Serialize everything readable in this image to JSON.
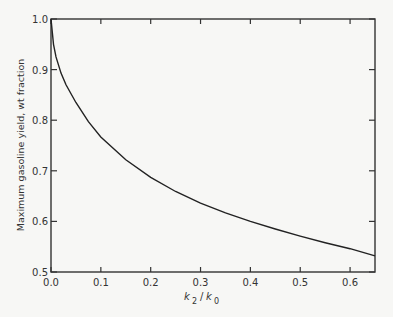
{
  "chart_data": {
    "type": "line",
    "title": "",
    "xlabel": "k2 / k0",
    "ylabel": "Maximum gasoline yield, wt fraction",
    "xlim": [
      0.0,
      0.65
    ],
    "ylim": [
      0.5,
      1.0
    ],
    "x_ticks": [
      "0.0",
      "0.1",
      "0.2",
      "0.3",
      "0.4",
      "0.5",
      "0.6"
    ],
    "y_ticks": [
      "0.5",
      "0.6",
      "0.7",
      "0.8",
      "0.9",
      "1.0"
    ],
    "grid": false,
    "series": [
      {
        "name": "Maximum gasoline yield",
        "x": [
          0.0,
          0.005,
          0.01,
          0.02,
          0.03,
          0.05,
          0.075,
          0.1,
          0.15,
          0.2,
          0.25,
          0.3,
          0.35,
          0.4,
          0.45,
          0.5,
          0.55,
          0.6,
          0.65
        ],
        "values": [
          1.0,
          0.95,
          0.925,
          0.893,
          0.87,
          0.835,
          0.797,
          0.767,
          0.722,
          0.687,
          0.659,
          0.636,
          0.617,
          0.6,
          0.585,
          0.571,
          0.558,
          0.546,
          0.532
        ]
      }
    ]
  },
  "labels": {
    "xlabel_k": "k",
    "xlabel_sub2": "2",
    "xlabel_slash": "/",
    "xlabel_sub0": "0"
  }
}
